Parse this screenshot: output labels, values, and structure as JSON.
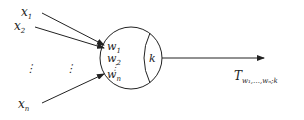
{
  "diagram": {
    "type": "neuron",
    "inputs": [
      {
        "name": "x",
        "sub": "1"
      },
      {
        "name": "x",
        "sub": "2"
      },
      {
        "name": "x",
        "sub": "n"
      }
    ],
    "ellipsis": "⋮",
    "weights": [
      {
        "name": "w",
        "sub": "1"
      },
      {
        "name": "w",
        "sub": "2"
      },
      {
        "name": "w",
        "sub": "n"
      }
    ],
    "weights_ellipsis": "⋮",
    "threshold": "k",
    "output": {
      "name": "T",
      "sub": "w₁,…,wₙ;k"
    },
    "stroke_color": "#222222"
  }
}
